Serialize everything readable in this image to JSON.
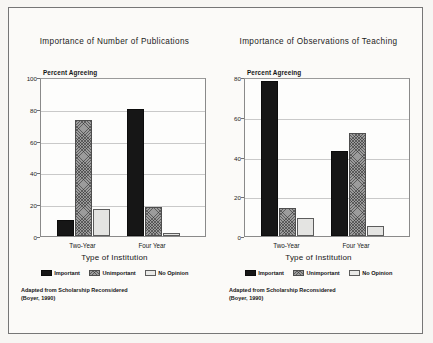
{
  "figure": {
    "source_note_line1": "Adapted from Scholarship Reconsidered",
    "source_note_line2": "(Boyer, 1990)",
    "x_axis_title": "Type of Institution",
    "y_axis_caption": "Percent Agreeing",
    "legend": [
      {
        "label": "Important",
        "color": "#161616",
        "pattern": "solid-black"
      },
      {
        "label": "Unimportant",
        "color": "#9c9c9c",
        "pattern": "gray-crosshatch"
      },
      {
        "label": "No Opinion",
        "color": "#e4e4e2",
        "pattern": "light-solid"
      }
    ]
  },
  "chart_data": [
    {
      "type": "bar",
      "title": "Importance of Number of Publications",
      "xlabel": "Type of Institution",
      "ylabel": "Percent Agreeing",
      "categories": [
        "Two-Year",
        "Four Year"
      ],
      "series": [
        {
          "name": "Important",
          "values": [
            10,
            80
          ]
        },
        {
          "name": "Unimportant",
          "values": [
            73,
            18
          ]
        },
        {
          "name": "No Opinion",
          "values": [
            17,
            2
          ]
        }
      ],
      "ylim": [
        0,
        100
      ],
      "yticks": [
        0,
        20,
        40,
        60,
        80,
        100
      ],
      "grid": true,
      "legend_position": "bottom"
    },
    {
      "type": "bar",
      "title": "Importance of Observations of Teaching",
      "xlabel": "Type of Institution",
      "ylabel": "Percent Agreeing",
      "categories": [
        "Two-Year",
        "Four Year"
      ],
      "series": [
        {
          "name": "Important",
          "values": [
            78,
            43
          ]
        },
        {
          "name": "Unimportant",
          "values": [
            14,
            52
          ]
        },
        {
          "name": "No Opinion",
          "values": [
            9,
            5
          ]
        }
      ],
      "ylim": [
        0,
        80
      ],
      "yticks": [
        0,
        20,
        40,
        60,
        80
      ],
      "grid": true,
      "legend_position": "bottom"
    }
  ]
}
